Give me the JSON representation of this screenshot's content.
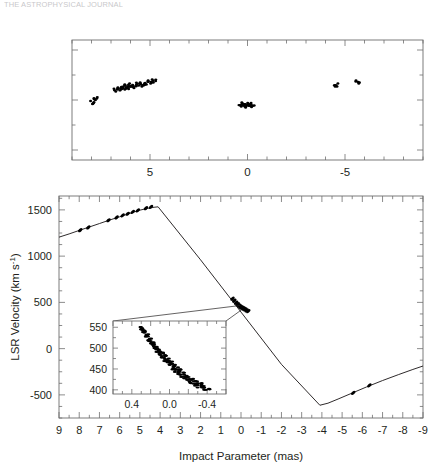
{
  "figure": {
    "clipped_header_text": "THE ASTROPHYSICAL JOURNAL",
    "panels": [
      "sky-distribution-panel",
      "position-velocity-panel"
    ]
  },
  "top_panel": {
    "name": "sky-distribution",
    "xaxis": {
      "ticklabels": [
        "5",
        "0",
        "-5"
      ],
      "tickvalues": [
        5,
        0,
        -5
      ],
      "range": [
        9,
        -9
      ],
      "minor_tick_step": 1
    },
    "yaxis": {
      "ticklabels": [],
      "range": [
        -1.2,
        1.2
      ]
    }
  },
  "main_panel": {
    "name": "position-velocity",
    "xlabel": "Impact Parameter (mas)",
    "ylabel": "LSR Velocity (km s",
    "ylabel_exp": "-1",
    "ylabel_close": ")",
    "xaxis": {
      "ticklabels": [
        "9",
        "8",
        "7",
        "6",
        "5",
        "4",
        "3",
        "2",
        "1",
        "0",
        "-1",
        "-2",
        "-3",
        "-4",
        "-5",
        "-6",
        "-7",
        "-8",
        "-9"
      ],
      "tickvalues": [
        9,
        8,
        7,
        6,
        5,
        4,
        3,
        2,
        1,
        0,
        -1,
        -2,
        -3,
        -4,
        -5,
        -6,
        -7,
        -8,
        -9
      ],
      "range": [
        9,
        -9
      ]
    },
    "yaxis": {
      "ticklabels": [
        "1500",
        "1000",
        "500",
        "0",
        "-500"
      ],
      "tickvalues": [
        1500,
        1000,
        500,
        0,
        -500
      ],
      "range": [
        -750,
        1650
      ]
    }
  },
  "inset_panel": {
    "name": "systemic-maser-inset",
    "xaxis": {
      "ticklabels": [
        "0.4",
        "0.0",
        "-0.4"
      ],
      "tickvalues": [
        0.4,
        0.0,
        -0.4
      ],
      "range": [
        0.6,
        -0.6
      ]
    },
    "yaxis": {
      "ticklabels": [
        "550",
        "500",
        "450",
        "400"
      ],
      "tickvalues": [
        550,
        500,
        450,
        400
      ],
      "range": [
        390,
        565
      ]
    }
  },
  "chart_data": {
    "type": "scatter",
    "title": "",
    "xlabel": "Impact Parameter (mas)",
    "ylabel": "LSR Velocity (km s^-1)",
    "xlim": [
      9,
      -9
    ],
    "ylim": [
      -750,
      1650
    ],
    "grid": false,
    "legend": "none",
    "series": [
      {
        "name": "keplerian-model-high-velocity-red",
        "type": "line",
        "comment": "rising branch from x=9 to turnover near x=4",
        "x": [
          9.0,
          8.5,
          8.0,
          7.5,
          7.0,
          6.5,
          6.0,
          5.5,
          5.0,
          4.6,
          4.3,
          4.1
        ],
        "y": [
          1205,
          1240,
          1278,
          1315,
          1352,
          1390,
          1425,
          1462,
          1497,
          1517,
          1528,
          1533
        ]
      },
      {
        "name": "keplerian-model-inner-falling",
        "type": "line",
        "comment": "steep inner straight segment through systemic region down to x=-4",
        "x": [
          4.1,
          2.0,
          0.0,
          -2.0,
          -3.9
        ],
        "y": [
          1533,
          960,
          395,
          -170,
          -612
        ]
      },
      {
        "name": "keplerian-model-high-velocity-blue",
        "type": "line",
        "comment": "rising branch from turnover x=-4 out to x=-9",
        "x": [
          -3.9,
          -4.3,
          -4.8,
          -5.5,
          -6.2,
          -7.0,
          -7.8,
          -8.5,
          -9.0
        ],
        "y": [
          -612,
          -590,
          -545,
          -480,
          -415,
          -345,
          -280,
          -225,
          -188
        ]
      },
      {
        "name": "high-velocity-masers-red",
        "type": "scatter",
        "x": [
          7.95,
          7.55,
          6.55,
          6.15,
          5.85,
          5.6,
          5.35,
          5.1,
          4.7,
          4.45
        ],
        "y": [
          1280,
          1310,
          1388,
          1418,
          1440,
          1458,
          1478,
          1495,
          1518,
          1532
        ]
      },
      {
        "name": "systemic-masers",
        "type": "scatter",
        "x": [
          0.42,
          0.33,
          0.24,
          0.16,
          0.09,
          0.03,
          -0.02,
          -0.08,
          -0.14,
          -0.21,
          -0.28,
          -0.36
        ],
        "y": [
          540,
          520,
          498,
          481,
          466,
          455,
          447,
          440,
          432,
          424,
          414,
          406
        ]
      },
      {
        "name": "high-velocity-masers-blue",
        "type": "scatter",
        "x": [
          -5.55,
          -6.35
        ],
        "y": [
          -478,
          -398
        ]
      }
    ],
    "inset": {
      "type": "scatter",
      "xlim": [
        0.6,
        -0.6
      ],
      "ylim": [
        390,
        565
      ],
      "xlabel": "",
      "ylabel": "",
      "x": [
        0.3,
        0.27,
        0.24,
        0.21,
        0.18,
        0.15,
        0.12,
        0.09,
        0.06,
        0.03,
        0.0,
        -0.03,
        -0.06,
        -0.09,
        -0.12,
        -0.15,
        -0.18,
        -0.22,
        -0.26,
        -0.3,
        -0.34,
        -0.38
      ],
      "y": [
        548,
        540,
        530,
        520,
        511,
        502,
        494,
        487,
        480,
        472,
        466,
        459,
        452,
        446,
        440,
        434,
        429,
        423,
        418,
        413,
        408,
        403
      ]
    },
    "sky_panel": {
      "type": "scatter",
      "xlim": [
        9,
        -9
      ],
      "ylim": [
        -1.2,
        1.2
      ],
      "xlabel": "",
      "ylabel": "",
      "x": [
        7.95,
        7.8,
        6.75,
        6.55,
        6.4,
        6.3,
        6.2,
        6.1,
        5.95,
        5.8,
        5.6,
        5.4,
        5.2,
        5.0,
        4.8,
        0.35,
        0.2,
        0.05,
        -0.1,
        -0.25,
        -4.55,
        -5.65
      ],
      "y": [
        -0.05,
        0.03,
        0.2,
        0.22,
        0.26,
        0.24,
        0.28,
        0.25,
        0.3,
        0.27,
        0.32,
        0.3,
        0.34,
        0.36,
        0.38,
        -0.1,
        -0.08,
        -0.12,
        -0.09,
        -0.11,
        0.3,
        0.36
      ]
    }
  },
  "colors": {
    "ink": "#231f20",
    "frame": "#5a5a5a",
    "marker": "#000000",
    "faint": "#9b9aa0"
  }
}
